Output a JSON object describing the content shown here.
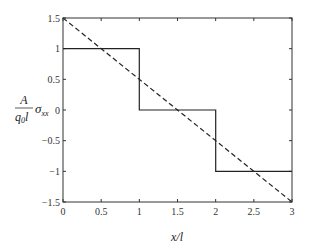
{
  "chart_data": {
    "type": "line",
    "title": "",
    "xlabel": "x/l",
    "ylabel": "A/(q0 l) σxx",
    "ylabel_parts": {
      "numerator": "A",
      "denominator": "q",
      "denominator_sub": "0",
      "denominator_tail": "l",
      "symbol": "σ",
      "symbol_sub": "xx"
    },
    "xlim": [
      0,
      3
    ],
    "ylim": [
      -1.5,
      1.5
    ],
    "xticks": [
      0,
      0.5,
      1,
      1.5,
      2,
      2.5,
      3
    ],
    "xtick_labels": [
      "0",
      "0.5",
      "1",
      "1.5",
      "2",
      "2.5",
      "3"
    ],
    "yticks": [
      -1.5,
      -1,
      -0.5,
      0,
      0.5,
      1,
      1.5
    ],
    "ytick_labels": [
      "−1.5",
      "−1",
      "−0.5",
      "0",
      "0.5",
      "1",
      "1.5"
    ],
    "grid": false,
    "legend": null,
    "series": [
      {
        "name": "piecewise constant (step)",
        "style": "solid",
        "color": "#222222",
        "x": [
          0,
          1,
          1,
          2,
          2,
          3
        ],
        "y": [
          1,
          1,
          0,
          0,
          -1,
          -1
        ]
      },
      {
        "name": "linear (exact)",
        "style": "dashed",
        "color": "#222222",
        "x": [
          0,
          3
        ],
        "y": [
          1.5,
          -1.5
        ]
      }
    ]
  }
}
